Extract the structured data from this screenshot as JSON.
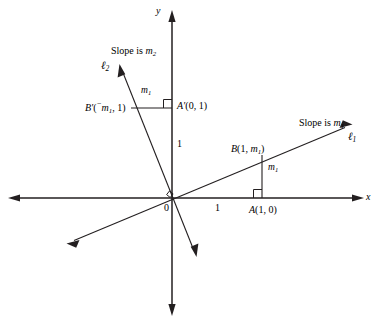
{
  "figure": {
    "kind": "coordinate-geometry-diagram",
    "background_color": "#ffffff",
    "stroke_color": "#231f20",
    "text_color": "#000000"
  },
  "axes": {
    "x_label": "x",
    "y_label": "y",
    "origin_label": "0",
    "x_unit_tick_label": "1",
    "y_unit_tick_label": "1",
    "x_range_px": [
      8,
      364
    ],
    "y_range_px": [
      10,
      316
    ],
    "origin_px": [
      172,
      198
    ],
    "unit_px": 90,
    "arrowheads": "both-ends-on-both-axes"
  },
  "lines": [
    {
      "id": "l1",
      "name_main": "ℓ",
      "name_sub": "1",
      "slope_text_prefix": "Slope is ",
      "slope_text_main": "m",
      "slope_text_sub": "1",
      "through_origin": true,
      "direction": "positive-slope rising to the right",
      "arrow_start_px": [
        68,
        243
      ],
      "arrow_end_px": [
        350,
        125
      ]
    },
    {
      "id": "l2",
      "name_main": "ℓ",
      "name_sub": "2",
      "slope_text_prefix": "Slope is ",
      "slope_text_main": "m",
      "slope_text_sub": "2",
      "through_origin": true,
      "direction": "steep negative slope falling to the right",
      "arrow_start_px": [
        120,
        68
      ],
      "arrow_end_px": [
        196,
        254
      ]
    }
  ],
  "points": [
    {
      "id": "A",
      "label_main": "A",
      "label_paren": "(1, 0)",
      "coords": [
        1,
        0
      ],
      "px": [
        262,
        198
      ]
    },
    {
      "id": "B",
      "label_main": "B",
      "label_open": "(1, ",
      "label_var": "m",
      "label_sub": "1",
      "label_close": ")",
      "coords_text": "(1, m₁)",
      "px": [
        262,
        155
      ]
    },
    {
      "id": "A-prime",
      "label_main": "A′",
      "label_paren": "(0, 1)",
      "coords": [
        0,
        1
      ],
      "px": [
        172,
        108
      ]
    },
    {
      "id": "B-prime",
      "label_main": "B′",
      "label_open": "(",
      "label_minus": "⁻",
      "label_var": "m",
      "label_sub": "1",
      "label_close": ", 1)",
      "coords_text": "(⁻m₁, 1)",
      "px": [
        131,
        108
      ]
    }
  ],
  "segments": [
    {
      "id": "vertical-m1",
      "label_main": "m",
      "label_sub": "1",
      "from_px": [
        262,
        155
      ],
      "to_px": [
        262,
        198
      ],
      "orientation": "vertical",
      "label_px": [
        268,
        168
      ]
    },
    {
      "id": "horizontal-m1",
      "label_main": "m",
      "label_sub": "1",
      "from_px": [
        131,
        108
      ],
      "to_px": [
        172,
        108
      ],
      "orientation": "horizontal",
      "label_px": [
        142,
        90
      ]
    }
  ],
  "right_angle_markers": [
    {
      "id": "origin-right-angle",
      "px": [
        172,
        198
      ]
    },
    {
      "id": "A-right-angle",
      "px": [
        262,
        198
      ]
    },
    {
      "id": "A-prime-right-angle",
      "px": [
        172,
        108
      ]
    }
  ],
  "annotations": {
    "slope_l1_prefix": "Slope is ",
    "slope_l1_var": "m",
    "slope_l1_sub": "1",
    "slope_l1_px": [
      300,
      124
    ],
    "slope_l2_prefix": "Slope is ",
    "slope_l2_var": "m",
    "slope_l2_sub": "2",
    "slope_l2_px": [
      112,
      52
    ],
    "l1_name_px": [
      350,
      140
    ],
    "l2_name_px": [
      104,
      68
    ]
  }
}
